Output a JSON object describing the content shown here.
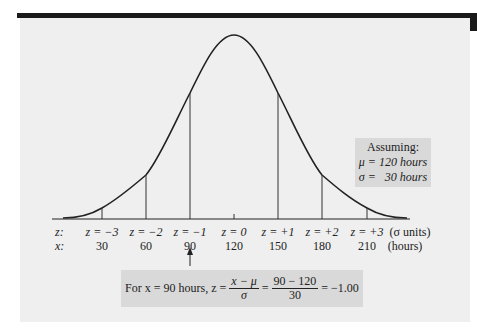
{
  "figure": {
    "assumption_box": {
      "title": "Assuming:",
      "mu_line": "μ = 120 hours",
      "sigma_line": "σ =   30 hours"
    },
    "axis": {
      "z_row_label": "z:",
      "x_row_label": "x:",
      "z_unit_label": "(σ units)",
      "x_unit_label": "(hours)",
      "ticks": [
        {
          "z": "z = −3",
          "x": "30"
        },
        {
          "z": "z = −2",
          "x": "60"
        },
        {
          "z": "z = −1",
          "x": "90"
        },
        {
          "z": "z = 0",
          "x": "120"
        },
        {
          "z": "z = +1",
          "x": "150"
        },
        {
          "z": "z = +2",
          "x": "180"
        },
        {
          "z": "z = +3",
          "x": "210"
        }
      ]
    },
    "formula_box": {
      "prefix": "For x = 90 hours, z =",
      "frac1_num": "x − μ",
      "frac1_den": "σ",
      "eq1": "=",
      "frac2_num": "90 − 120",
      "frac2_den": "30",
      "result": "= −1.00"
    },
    "colors": {
      "panel": "#efefef",
      "box": "#d9d9d9",
      "ink": "#222222",
      "top_bar": "#1a1a1a"
    }
  }
}
